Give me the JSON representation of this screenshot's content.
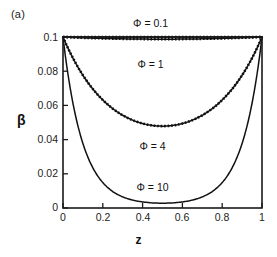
{
  "figure": {
    "panel_tag": "(a)",
    "background_color": "#ffffff",
    "frame_color": "#1a1a1a",
    "curve_color": "#111111"
  },
  "chart_data": {
    "type": "line",
    "title": "",
    "subtitle": "",
    "panel": "(a)",
    "xlabel": "z",
    "ylabel": "β",
    "xlim": [
      0,
      1
    ],
    "ylim": [
      0,
      0.1
    ],
    "grid": false,
    "legend_position": "inline-annotations",
    "x_ticks": [
      0,
      0.2,
      0.4,
      0.6,
      0.8,
      1
    ],
    "x_tick_labels": [
      "0",
      "0.2",
      "0.4",
      "0.6",
      "0.8",
      "1"
    ],
    "y_ticks": [
      0,
      0.02,
      0.04,
      0.06,
      0.08,
      0.1
    ],
    "y_tick_labels": [
      "0",
      "0.02",
      "0.04",
      "0.06",
      "0.08",
      "0.1"
    ],
    "x": [
      0,
      0.025,
      0.05,
      0.075,
      0.1,
      0.125,
      0.15,
      0.175,
      0.2,
      0.225,
      0.25,
      0.275,
      0.3,
      0.325,
      0.35,
      0.375,
      0.4,
      0.425,
      0.45,
      0.475,
      0.5,
      0.525,
      0.55,
      0.575,
      0.6,
      0.625,
      0.65,
      0.675,
      0.7,
      0.725,
      0.75,
      0.775,
      0.8,
      0.825,
      0.85,
      0.875,
      0.9,
      0.925,
      0.95,
      0.975,
      1
    ],
    "series": [
      {
        "name": "Φ = 0.1",
        "phi": 0.1,
        "style": "solid-with-dashed-overlay",
        "label_x": 0.44,
        "label_y": 0.108,
        "min_value": 0.0999,
        "boundary_value": 0.1,
        "values": [
          0.1,
          0.09999,
          0.09997,
          0.09995,
          0.09993,
          0.09991,
          0.09989,
          0.09988,
          0.09986,
          0.09985,
          0.09984,
          0.09983,
          0.09982,
          0.09981,
          0.09981,
          0.0998,
          0.0998,
          0.0998,
          0.0998,
          0.0998,
          0.0998,
          0.0998,
          0.0998,
          0.0998,
          0.0998,
          0.0998,
          0.09981,
          0.09981,
          0.09982,
          0.09983,
          0.09984,
          0.09985,
          0.09986,
          0.09988,
          0.09989,
          0.09991,
          0.09993,
          0.09995,
          0.09997,
          0.09999,
          0.1
        ]
      },
      {
        "name": "Φ = 1",
        "phi": 1,
        "style": "solid-with-dashed-overlay",
        "label_x": 0.44,
        "label_y": 0.0845,
        "min_value": 0.0888,
        "boundary_value": 0.1,
        "values": [
          0.1,
          0.09805,
          0.09633,
          0.09482,
          0.09351,
          0.09238,
          0.09143,
          0.09064,
          0.09,
          0.08951,
          0.08915,
          0.08891,
          0.0888,
          0.08891,
          0.08915,
          0.08951,
          0.08881,
          0.08878,
          0.08876,
          0.08875,
          0.08875,
          0.08875,
          0.08876,
          0.08878,
          0.08881,
          0.08951,
          0.08915,
          0.08891,
          0.0888,
          0.08891,
          0.08915,
          0.08951,
          0.09,
          0.09064,
          0.09143,
          0.09238,
          0.09351,
          0.09482,
          0.09633,
          0.09805,
          0.1
        ]
      },
      {
        "name": "Φ = 4",
        "phi": 4,
        "style": "solid-with-dashed-overlay",
        "label_x": 0.45,
        "label_y": 0.036,
        "min_value": 0.029,
        "boundary_value": 0.1,
        "values": [
          0.1,
          0.0909,
          0.0828,
          0.0756,
          0.0692,
          0.0635,
          0.0585,
          0.0541,
          0.0503,
          0.0469,
          0.044,
          0.0414,
          0.0392,
          0.0373,
          0.0357,
          0.0344,
          0.0333,
          0.0324,
          0.0317,
          0.0312,
          0.029,
          0.0312,
          0.0317,
          0.0324,
          0.0333,
          0.0344,
          0.0357,
          0.0373,
          0.0392,
          0.0414,
          0.044,
          0.0469,
          0.0503,
          0.0541,
          0.0585,
          0.0635,
          0.0692,
          0.0756,
          0.0828,
          0.0909,
          0.1
        ]
      },
      {
        "name": "Φ = 10",
        "phi": 10,
        "style": "solid",
        "label_x": 0.45,
        "label_y": 0.0122,
        "min_value": 0.0015,
        "boundary_value": 0.1,
        "values": [
          0.1,
          0.0786,
          0.0618,
          0.0487,
          0.0384,
          0.0303,
          0.0239,
          0.0189,
          0.015,
          0.0119,
          0.0094,
          0.0075,
          0.006,
          0.0048,
          0.0039,
          0.0031,
          0.0026,
          0.0022,
          0.0018,
          0.0016,
          0.0015,
          0.0016,
          0.0018,
          0.0022,
          0.0026,
          0.0031,
          0.0039,
          0.0048,
          0.006,
          0.0075,
          0.0094,
          0.0119,
          0.015,
          0.0189,
          0.0239,
          0.0303,
          0.0384,
          0.0487,
          0.0618,
          0.0786,
          0.1
        ]
      }
    ]
  }
}
